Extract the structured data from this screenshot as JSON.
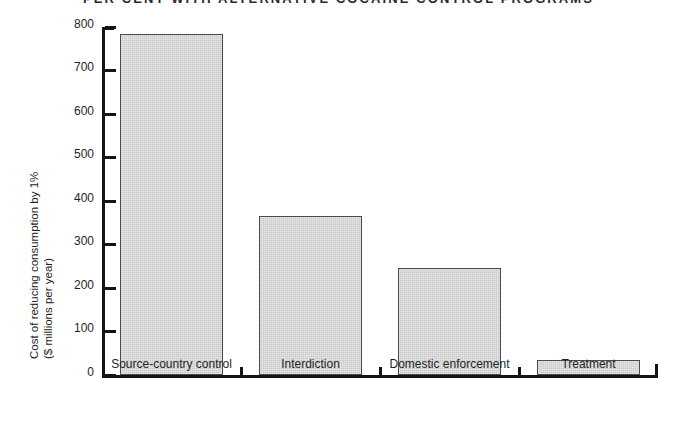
{
  "chart_data": {
    "type": "bar",
    "title": "PER CENT WITH ALTERNATIVE COCAINE CONTROL PROGRAMS",
    "xlabel": "",
    "ylabel_line1": "Cost of reducing consumption by 1%",
    "ylabel_line2": "($ millions per year)",
    "categories": [
      "Source-country control",
      "Interdiction",
      "Domestic enforcement",
      "Treatment"
    ],
    "values": [
      783,
      366,
      246,
      34
    ],
    "ylim": [
      0,
      800
    ],
    "yticks": [
      0,
      100,
      200,
      300,
      400,
      500,
      600,
      700,
      800
    ],
    "ytick_labels": [
      "0",
      "100",
      "200",
      "300",
      "400",
      "500",
      "600",
      "700",
      "800"
    ],
    "grid": false,
    "legend": "none",
    "bar_fill_color": "#c9c9c9",
    "bar_edge_color": "#4a4a4a",
    "axis_color": "#141414"
  }
}
